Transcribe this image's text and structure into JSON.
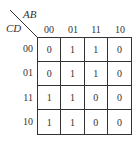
{
  "kmap": {
    "column_variable": "AB",
    "row_variable": "CD",
    "column_headers": [
      "00",
      "01",
      "11",
      "10"
    ],
    "row_headers": [
      "00",
      "01",
      "11",
      "10"
    ],
    "cells": [
      [
        "0",
        "1",
        "1",
        "0"
      ],
      [
        "0",
        "1",
        "1",
        "0"
      ],
      [
        "1",
        "1",
        "0",
        "0"
      ],
      [
        "1",
        "1",
        "0",
        "0"
      ]
    ]
  }
}
